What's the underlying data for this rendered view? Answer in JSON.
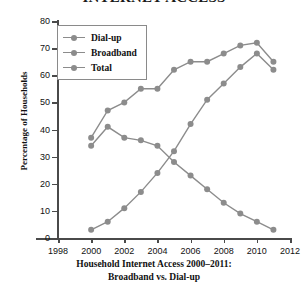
{
  "figure": {
    "title_clipped": "INTERNET ACCESS",
    "caption_line1": "Household Internet Access 2000–2011:",
    "caption_line2": "Broadband vs. Dial-up"
  },
  "colors": {
    "series": "#8c8c8c",
    "axis": "#4a4a4a",
    "text": "#111111",
    "background": "#ffffff"
  },
  "chart_data": {
    "type": "line",
    "title": "INTERNET ACCESS",
    "xlabel": "",
    "ylabel": "Percentage of Households",
    "xlim": [
      1998,
      2012
    ],
    "ylim": [
      0,
      80
    ],
    "xticks": [
      1998,
      2000,
      2002,
      2004,
      2006,
      2008,
      2010,
      2012
    ],
    "yticks": [
      0,
      10,
      20,
      30,
      40,
      50,
      60,
      70,
      80
    ],
    "grid": false,
    "legend_position": "top-left",
    "x": [
      2000,
      2001,
      2002,
      2003,
      2004,
      2005,
      2006,
      2007,
      2008,
      2009,
      2010,
      2011
    ],
    "series": [
      {
        "name": "Dial-up",
        "values": [
          34,
          41,
          37,
          36,
          34,
          28,
          23,
          18,
          13,
          9,
          6,
          3
        ]
      },
      {
        "name": "Broadband",
        "values": [
          3,
          6,
          11,
          17,
          24,
          32,
          42,
          51,
          57,
          63,
          68,
          62
        ]
      },
      {
        "name": "Total",
        "values": [
          37,
          47,
          50,
          55,
          55,
          62,
          65,
          65,
          68,
          71,
          72,
          65
        ]
      }
    ]
  }
}
